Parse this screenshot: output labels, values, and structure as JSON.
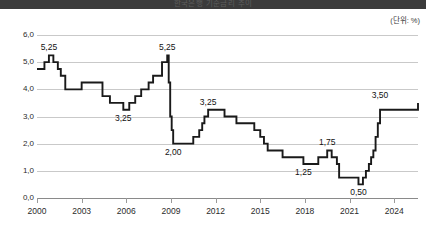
{
  "banner": {
    "title": "한국은행 기준금리 추이"
  },
  "unit_note": "(단위: %)",
  "chart_data": {
    "type": "line",
    "line_style": "step",
    "title": "한국은행 기준금리 추이",
    "xlabel": "",
    "ylabel": "",
    "unit": "(단위: %)",
    "grid": true,
    "legend": "none",
    "xlim": [
      2000,
      2025.6
    ],
    "ylim": [
      0.0,
      6.0
    ],
    "ytick_labels": [
      "0,0",
      "1,0",
      "2,0",
      "3,0",
      "4,0",
      "5,0",
      "6,0"
    ],
    "ytick_values": [
      0.0,
      1.0,
      2.0,
      3.0,
      4.0,
      5.0,
      6.0
    ],
    "xtick_labels": [
      "2000",
      "2003",
      "2006",
      "2009",
      "2012",
      "2015",
      "2018",
      "2021",
      "2024"
    ],
    "xtick_values": [
      2000,
      2003,
      2006,
      2009,
      2012,
      2015,
      2018,
      2021,
      2024
    ],
    "x": [
      2000.0,
      2000.5,
      2000.8,
      2001.1,
      2001.4,
      2001.6,
      2001.9,
      2002.4,
      2003.0,
      2003.5,
      2004.4,
      2004.9,
      2005.8,
      2006.2,
      2006.6,
      2007.0,
      2007.5,
      2007.8,
      2008.4,
      2008.75,
      2008.85,
      2008.95,
      2009.05,
      2009.15,
      2010.5,
      2010.9,
      2011.1,
      2011.25,
      2011.5,
      2012.6,
      2013.4,
      2014.6,
      2015.0,
      2015.25,
      2015.5,
      2016.5,
      2017.9,
      2018.9,
      2019.5,
      2019.8,
      2020.15,
      2020.3,
      2021.6,
      2021.9,
      2022.1,
      2022.3,
      2022.45,
      2022.6,
      2022.75,
      2022.9,
      2023.05,
      2025.6
    ],
    "y": [
      4.75,
      5.0,
      5.25,
      5.0,
      4.75,
      4.5,
      4.0,
      4.0,
      4.25,
      4.25,
      3.75,
      3.5,
      3.25,
      3.5,
      3.75,
      4.0,
      4.25,
      4.5,
      5.0,
      5.25,
      4.25,
      3.0,
      2.5,
      2.0,
      2.25,
      2.5,
      2.75,
      3.0,
      3.25,
      3.0,
      2.75,
      2.5,
      2.25,
      2.0,
      1.75,
      1.5,
      1.25,
      1.5,
      1.75,
      1.5,
      1.25,
      0.75,
      0.5,
      0.75,
      1.0,
      1.25,
      1.5,
      1.75,
      2.25,
      2.75,
      3.25,
      3.5
    ],
    "annotations": [
      {
        "label": "5,25",
        "value": 5.25,
        "x": 2000.8,
        "position": "above"
      },
      {
        "label": "3,25",
        "value": 3.25,
        "x": 2005.8,
        "position": "below"
      },
      {
        "label": "5,25",
        "value": 5.25,
        "x": 2008.75,
        "position": "above"
      },
      {
        "label": "2,00",
        "value": 2.0,
        "x": 2009.15,
        "position": "below"
      },
      {
        "label": "3,25",
        "value": 3.25,
        "x": 2011.5,
        "position": "above"
      },
      {
        "label": "1,25",
        "value": 1.25,
        "x": 2017.9,
        "position": "below"
      },
      {
        "label": "1,75",
        "value": 1.75,
        "x": 2019.5,
        "position": "above"
      },
      {
        "label": "0,50",
        "value": 0.5,
        "x": 2021.6,
        "position": "below"
      },
      {
        "label": "3,50",
        "value": 3.5,
        "x": 2023.05,
        "position": "above"
      }
    ],
    "colors": {
      "line": "#1a1a1a",
      "grid": "#c9c9c9",
      "axis": "#8a8a8a",
      "banner": "#3b3b3b",
      "background": "#ffffff"
    }
  }
}
